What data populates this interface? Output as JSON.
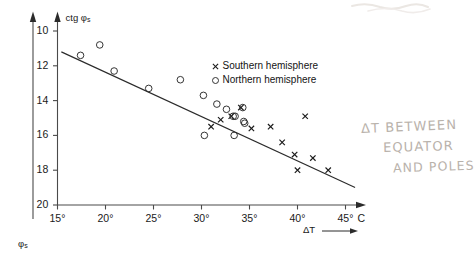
{
  "chart_data": {
    "type": "scatter",
    "title": "",
    "xlabel": "ΔT",
    "xunit": "°C",
    "ylabel": "ctg φs",
    "ylabel_secondary": "φs",
    "xlim": [
      15,
      45
    ],
    "ylim_inverted": [
      10,
      20
    ],
    "ylim_secondary_inverted": [
      45,
      25
    ],
    "grid": false,
    "legend_position": "upper right",
    "x_ticks": [
      "15°",
      "20°",
      "25°",
      "30°",
      "35°",
      "40°",
      "45°"
    ],
    "x_tick_values": [
      15,
      20,
      25,
      30,
      35,
      40,
      45
    ],
    "y_ticks": [
      "10",
      "12",
      "14",
      "16",
      "18",
      "20"
    ],
    "y_tick_values": [
      10,
      12,
      14,
      16,
      18,
      20
    ],
    "y_ticks_secondary": [
      "45°",
      "40°",
      "35°",
      "30°",
      "25°"
    ],
    "y_tick_secondary_values": [
      45,
      40,
      35,
      30,
      25
    ],
    "series": [
      {
        "name": "Southern hemisphere",
        "marker": "x",
        "color": "#1a1a1a",
        "points": [
          {
            "x": 32.0,
            "y": 15.1
          },
          {
            "x": 33.1,
            "y": 14.9
          },
          {
            "x": 34.1,
            "y": 14.4
          },
          {
            "x": 31.0,
            "y": 15.5
          },
          {
            "x": 35.2,
            "y": 15.6
          },
          {
            "x": 37.2,
            "y": 15.5
          },
          {
            "x": 38.4,
            "y": 16.4
          },
          {
            "x": 39.7,
            "y": 17.1
          },
          {
            "x": 40.0,
            "y": 18.0
          },
          {
            "x": 41.6,
            "y": 17.3
          },
          {
            "x": 43.2,
            "y": 18.0
          },
          {
            "x": 40.8,
            "y": 14.9
          }
        ]
      },
      {
        "name": "Northern hemisphere",
        "marker": "o",
        "color": "#2a2a2a",
        "points": [
          {
            "x": 17.4,
            "y": 11.4
          },
          {
            "x": 19.4,
            "y": 10.8
          },
          {
            "x": 20.9,
            "y": 12.3
          },
          {
            "x": 24.5,
            "y": 13.3
          },
          {
            "x": 27.8,
            "y": 12.8
          },
          {
            "x": 30.2,
            "y": 13.7
          },
          {
            "x": 31.6,
            "y": 14.2
          },
          {
            "x": 32.6,
            "y": 14.5
          },
          {
            "x": 33.3,
            "y": 14.9
          },
          {
            "x": 33.5,
            "y": 14.9
          },
          {
            "x": 34.3,
            "y": 14.4
          },
          {
            "x": 34.4,
            "y": 15.2
          },
          {
            "x": 34.5,
            "y": 15.3
          },
          {
            "x": 30.3,
            "y": 16.0
          },
          {
            "x": 33.4,
            "y": 16.0
          }
        ]
      }
    ],
    "trendline": {
      "x_start": 15.4,
      "y_start": 11.2,
      "x_end": 46.0,
      "y_end": 19.0,
      "color": "#2b2b2b"
    }
  },
  "legend": {
    "entries": [
      {
        "marker": "x",
        "label": "Southern hemisphere"
      },
      {
        "marker": "o",
        "label": "Northern hemisphere"
      }
    ]
  },
  "axis_labels": {
    "y_primary": "ctg",
    "y_primary_symbol": "φ",
    "y_primary_sub": "s",
    "y_secondary_symbol": "φ",
    "y_secondary_sub": "s",
    "x_symbol": "ΔT",
    "x_unit": "°C"
  },
  "annotations": {
    "handwritten": {
      "line1": "ΔT  BETWEEN",
      "line2": "EQUATOR",
      "line3": "AND POLES"
    }
  }
}
